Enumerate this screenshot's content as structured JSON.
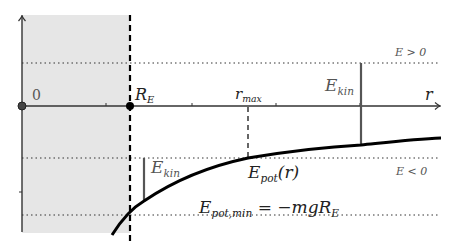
{
  "diagram": {
    "type": "potential-energy-diagram",
    "axes": {
      "x_label": "r",
      "origin_label": "0",
      "radius_label": "R",
      "radius_subscript": "E"
    },
    "levels": {
      "positive": "E > 0",
      "negative": "E < 0"
    },
    "labels": {
      "r_max": {
        "main": "r",
        "sub": "max"
      },
      "ekin_right": {
        "main": "E",
        "sub": "kin"
      },
      "ekin_left": {
        "main": "E",
        "sub": "kin"
      },
      "epot": {
        "main": "E",
        "sub": "pot",
        "suffix": "(r)"
      },
      "epot_min": {
        "main": "E",
        "sub": "pot,min",
        "rhs": " = −mgR",
        "rhs_sub": "E"
      }
    },
    "colors": {
      "shaded_region": "#e6e6e6",
      "curve": "#000000",
      "axis": "#333333",
      "energy_bar": "#555555"
    }
  }
}
